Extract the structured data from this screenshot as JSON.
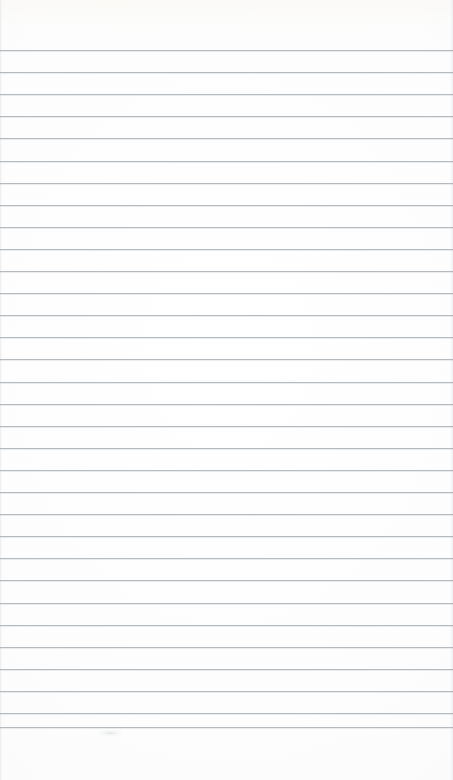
{
  "document": {
    "kind": "scanned-ruled-notebook-page",
    "title": "Blank ruled paper",
    "orientation": "portrait",
    "page_width": 453,
    "page_height": 780,
    "has_text_content": false,
    "visible_text": "",
    "handwriting_present": false
  },
  "paper": {
    "background_color": "#fdfdfd",
    "paper_tone": "white",
    "top_margin_px": 50,
    "bottom_margin_px": 53,
    "left_margin_px": 0,
    "right_margin_px": 0,
    "margin_rule_present": false
  },
  "ruling": {
    "style": "horizontal-ruled",
    "line_color": "#a9afb5",
    "line_thickness_px": 1,
    "line_spacing_px": 22.1,
    "first_line_y": 50,
    "last_line_y": 727,
    "line_count": 31,
    "lines_span_full_width": true,
    "line_start_x": 0,
    "line_end_x": 453,
    "line_positions": [
      50,
      72.1,
      94.2,
      116.3,
      138.4,
      160.5,
      182.6,
      204.7,
      226.8,
      248.9,
      271,
      293.1,
      315.2,
      337.3,
      359.4,
      381.5,
      403.6,
      425.7,
      447.8,
      469.9,
      492,
      514.1,
      536.2,
      558.3,
      580.4,
      602.5,
      624.6,
      646.7,
      668.8,
      690.9,
      713,
      727
    ]
  },
  "artifacts": {
    "scan_smudge": {
      "label": "faint scan smudge",
      "x": 110,
      "y": 733,
      "color": "#ced2d6"
    },
    "edge_shadow_left": "#d2d5d8",
    "edge_shadow_right": "#d6d9dc",
    "top_tint": "#faf9f6"
  }
}
